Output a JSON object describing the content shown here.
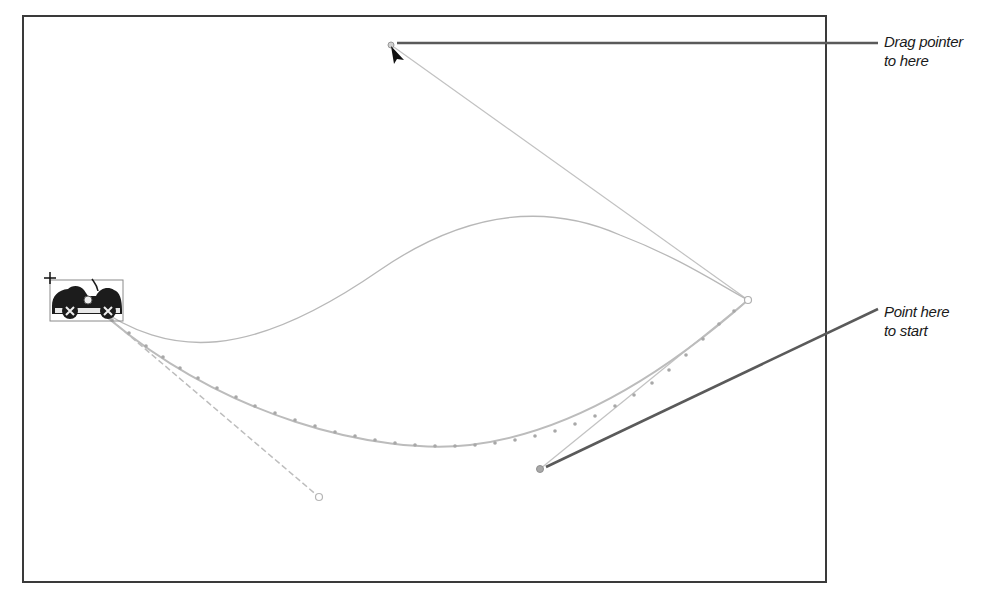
{
  "canvas": {
    "frame_color": "#3a3a3a",
    "background": "#ffffff"
  },
  "motion_path": {
    "start_point": {
      "x": 88,
      "y": 300
    },
    "end_anchor": {
      "x": 748,
      "y": 300
    },
    "original_curve_color": "#bdbdbd",
    "new_curve_color": "#b5b5b5",
    "handle_color": "#c6c6c6"
  },
  "symbol": {
    "name": "car",
    "icon": "car-icon",
    "registration_mark": "+"
  },
  "callouts": [
    {
      "id": "drag",
      "lines": [
        "Drag pointer",
        "to here"
      ]
    },
    {
      "id": "start",
      "lines": [
        "Point here",
        "to start"
      ]
    }
  ],
  "pointer": {
    "icon": "arrow-cursor-icon"
  }
}
